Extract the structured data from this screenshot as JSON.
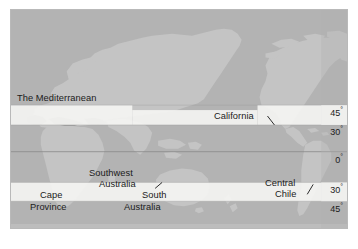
{
  "figure": {
    "kind": "world-map",
    "colors": {
      "ocean": "#b3b3b3",
      "land": "#c4c4c4",
      "land_shadow": "#a8a8a8",
      "band_highlight": "#f4f4f2",
      "frame_border": "#b9b9b9",
      "label_text": "#1b1b1b",
      "graticule": "#8f8f8f"
    },
    "bands": [
      {
        "name": "northern-mediterranean-belt",
        "from_deg": 30,
        "to_deg": 45,
        "hemisphere": "north"
      },
      {
        "name": "southern-mediterranean-belt",
        "from_deg": 30,
        "to_deg": 45,
        "hemisphere": "south"
      }
    ]
  },
  "region_labels": [
    {
      "id": "the-mediterranean",
      "text": "The Mediterranean"
    },
    {
      "id": "california",
      "text": "California"
    },
    {
      "id": "southwest-australia",
      "line1": "Southwest",
      "line2": "Australia"
    },
    {
      "id": "south-australia",
      "line1": "South",
      "line2": "Australia"
    },
    {
      "id": "cape-province",
      "line1": "Cape",
      "line2": "Province"
    },
    {
      "id": "central-chile",
      "line1": "Central",
      "line2": "Chile"
    }
  ],
  "latitude_labels": [
    {
      "id": "north-45",
      "value": "45",
      "degree": "°"
    },
    {
      "id": "north-30",
      "value": "30",
      "degree": "°"
    },
    {
      "id": "equator-0",
      "value": "0",
      "degree": "°"
    },
    {
      "id": "south-30",
      "value": "30",
      "degree": "°"
    },
    {
      "id": "south-45",
      "value": "45",
      "degree": "°"
    }
  ],
  "caption": {
    "text": ""
  }
}
